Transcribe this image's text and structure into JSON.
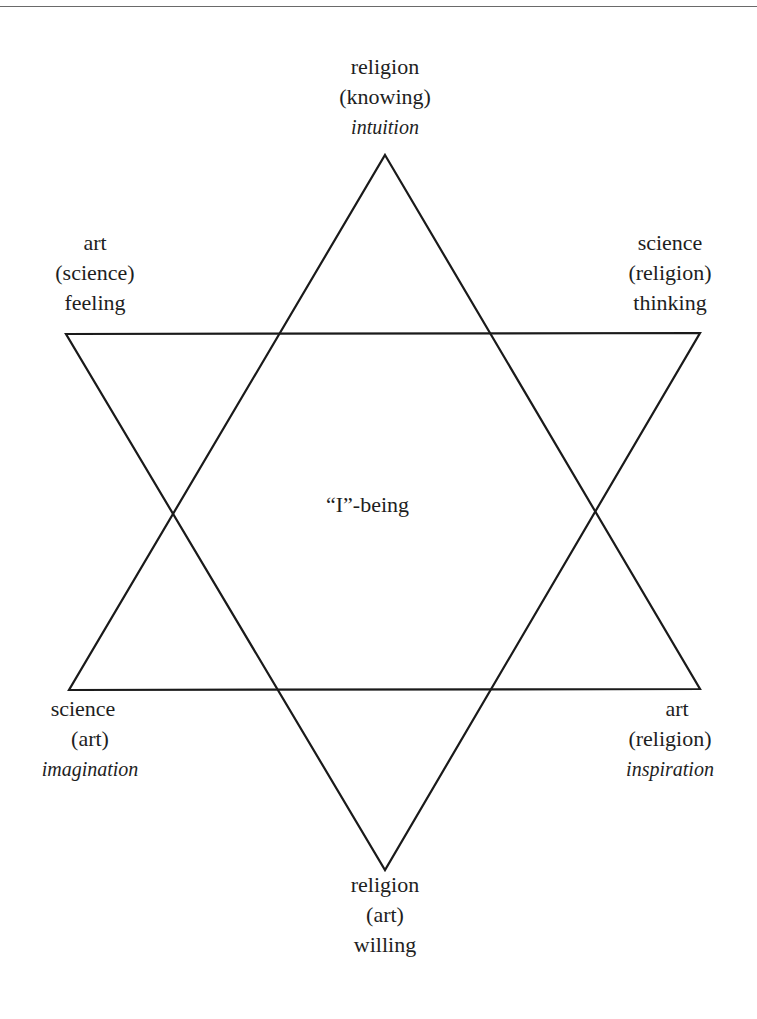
{
  "diagram": {
    "type": "hexagram",
    "stroke_color": "#1a1a1a",
    "center": {
      "label": "“I”-being"
    },
    "vertices": {
      "top": {
        "primary": "religion",
        "secondary": "(knowing)",
        "quality": "intuition",
        "quality_italic": true
      },
      "upper_left": {
        "primary": "art",
        "secondary": "(science)",
        "quality": "feeling",
        "quality_italic": false
      },
      "upper_right": {
        "primary": "science",
        "secondary": "(religion)",
        "quality": "thinking",
        "quality_italic": false
      },
      "lower_left": {
        "primary": "science",
        "secondary": "(art)",
        "quality": "imagination",
        "quality_italic": true
      },
      "lower_right": {
        "primary": "art",
        "secondary": "(religion)",
        "quality": "inspiration",
        "quality_italic": true
      },
      "bottom": {
        "primary": "religion",
        "secondary": "(art)",
        "quality": "willing",
        "quality_italic": false
      }
    }
  }
}
